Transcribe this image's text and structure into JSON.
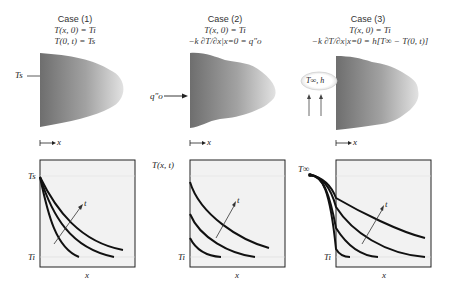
{
  "cases": [
    {
      "title": "Case (1)",
      "eq1": "T(x, 0) = Ti",
      "eq2": "T(0, t) = Ts",
      "surface_label": "Ts",
      "x_axis_arrow_label": "x",
      "plot": {
        "y_top_label": "Ts",
        "y_bottom_label": "Ti",
        "x_label": "x",
        "arrow_label": "t"
      }
    },
    {
      "title": "Case (2)",
      "eq1": "T(x, 0) = Ti",
      "eq2": "−k ∂T/∂x|x=0 = q″o",
      "flux_label": "q″o",
      "x_axis_arrow_label": "x",
      "plot": {
        "y_top_label": "T(x, t)",
        "y_bottom_label": "Ti",
        "x_label": "x",
        "arrow_label": "t"
      }
    },
    {
      "title": "Case (3)",
      "eq1": "T(x, 0) = Ti",
      "eq2": "−k ∂T/∂x|x=0 = h[T∞ − T(0, t)]",
      "fluid_label": "T∞, h",
      "x_axis_arrow_label": "x",
      "plot": {
        "y_top_label": "T∞",
        "y_bottom_label": "Ti",
        "x_label": "x",
        "arrow_label": "t"
      }
    }
  ]
}
